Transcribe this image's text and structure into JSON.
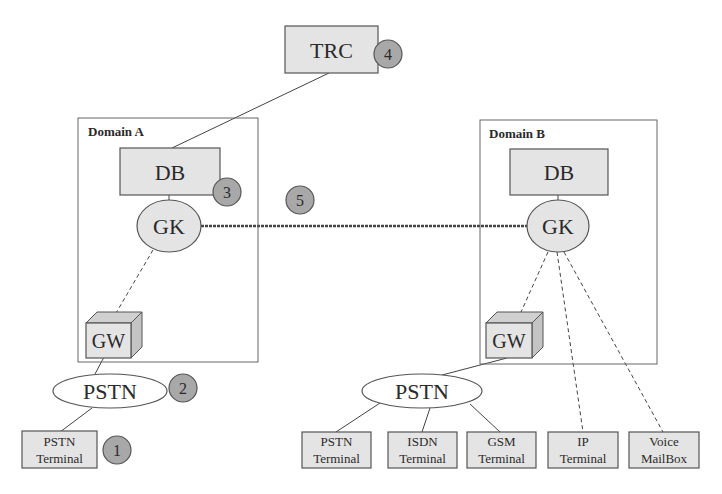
{
  "diagram": {
    "colors": {
      "box_fill": "#e4e4e4",
      "box_stroke": "#555555",
      "badge_fill": "#a8a8a8",
      "line": "#444444",
      "background": "#ffffff"
    },
    "trc": {
      "label": "TRC",
      "badge": "4"
    },
    "domain_a": {
      "label": "Domain A",
      "db": {
        "label": "DB",
        "badge": "3"
      },
      "gk": {
        "label": "GK"
      },
      "gw": {
        "label": "GW"
      }
    },
    "domain_b": {
      "label": "Domain B",
      "db": {
        "label": "DB"
      },
      "gk": {
        "label": "GK"
      },
      "gw": {
        "label": "GW"
      }
    },
    "inter_domain_link": {
      "badge": "5"
    },
    "pstn_a": {
      "label": "PSTN",
      "badge": "2"
    },
    "terminal_a": {
      "line1": "PSTN",
      "line2": "Terminal",
      "badge": "1"
    },
    "pstn_b": {
      "label": "PSTN"
    },
    "terminals_b": [
      {
        "line1": "PSTN",
        "line2": "Terminal"
      },
      {
        "line1": "ISDN",
        "line2": "Terminal"
      },
      {
        "line1": "GSM",
        "line2": "Terminal"
      },
      {
        "line1": "IP",
        "line2": "Terminal"
      },
      {
        "line1": "Voice",
        "line2": "MailBox"
      }
    ]
  }
}
